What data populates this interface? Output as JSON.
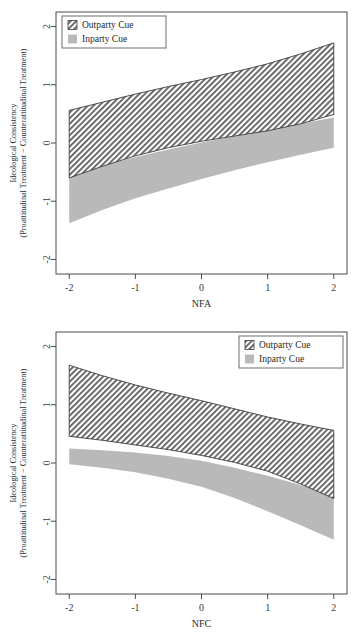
{
  "figure": {
    "background": "#ffffff",
    "series_colors": {
      "outparty": "#4a4a4a",
      "inparty": "#b9b9b9"
    }
  },
  "chart_data": [
    {
      "type": "area",
      "panel": "top",
      "title": "",
      "xlabel": "NFA",
      "ylabel": "Ideological Consistency",
      "ylabel_line2": "(Proattitudinal Treatment − Counterattitudinal Treatment)",
      "xlim": [
        -2.2,
        2.2
      ],
      "ylim": [
        -2.25,
        2.25
      ],
      "xticks": [
        -2,
        -1,
        0,
        1,
        2
      ],
      "xticklabels": [
        "-2",
        "-1",
        "0",
        "1",
        "2"
      ],
      "yticks": [
        -2,
        -1,
        0,
        1,
        2
      ],
      "yticklabels": [
        "-2",
        "-1",
        "0",
        "1",
        "2"
      ],
      "grid": false,
      "legend_position": "top-left",
      "legend": [
        {
          "label": "Outparty Cue",
          "style": "hatched"
        },
        {
          "label": "Inparty Cue",
          "style": "solid-gray"
        }
      ],
      "x": [
        -2,
        -1.5,
        -1,
        -0.5,
        0,
        0.5,
        1,
        1.5,
        2
      ],
      "series": [
        {
          "name": "Outparty Cue",
          "style": "hatched",
          "upper": [
            0.56,
            0.7,
            0.84,
            0.97,
            1.09,
            1.22,
            1.36,
            1.53,
            1.72
          ],
          "lower": [
            -0.6,
            -0.4,
            -0.22,
            -0.08,
            0.03,
            0.12,
            0.21,
            0.33,
            0.49
          ]
        },
        {
          "name": "Inparty Cue",
          "style": "solid-gray",
          "upper": [
            -0.55,
            -0.39,
            -0.24,
            -0.11,
            0.01,
            0.12,
            0.22,
            0.33,
            0.44
          ],
          "lower": [
            -1.38,
            -1.15,
            -0.95,
            -0.78,
            -0.62,
            -0.47,
            -0.33,
            -0.2,
            -0.08
          ]
        }
      ]
    },
    {
      "type": "area",
      "panel": "bottom",
      "title": "",
      "xlabel": "NFC",
      "ylabel": "Ideological Consistency",
      "ylabel_line2": "(Proattitudinal Treatment − Counterattitudinal Treatment)",
      "xlim": [
        -2.2,
        2.2
      ],
      "ylim": [
        -2.25,
        2.25
      ],
      "xticks": [
        -2,
        -1,
        0,
        1,
        2
      ],
      "xticklabels": [
        "-2",
        "-1",
        "0",
        "1",
        "2"
      ],
      "yticks": [
        -2,
        -1,
        0,
        1,
        2
      ],
      "yticklabels": [
        "-2",
        "-1",
        "0",
        "1",
        "2"
      ],
      "grid": false,
      "legend_position": "top-right",
      "legend": [
        {
          "label": "Outparty Cue",
          "style": "hatched"
        },
        {
          "label": "Inparty Cue",
          "style": "solid-gray"
        }
      ],
      "x": [
        -2,
        -1.5,
        -1,
        -0.5,
        0,
        0.5,
        1,
        1.5,
        2
      ],
      "series": [
        {
          "name": "Outparty Cue",
          "style": "hatched",
          "upper": [
            1.68,
            1.5,
            1.34,
            1.2,
            1.07,
            0.93,
            0.79,
            0.67,
            0.56
          ],
          "lower": [
            0.46,
            0.39,
            0.31,
            0.23,
            0.13,
            0.01,
            -0.14,
            -0.36,
            -0.61
          ]
        },
        {
          "name": "Inparty Cue",
          "style": "solid-gray",
          "upper": [
            0.25,
            0.22,
            0.18,
            0.12,
            0.04,
            -0.08,
            -0.22,
            -0.38,
            -0.55
          ],
          "lower": [
            -0.02,
            -0.08,
            -0.16,
            -0.27,
            -0.41,
            -0.6,
            -0.83,
            -1.07,
            -1.32
          ]
        }
      ]
    }
  ],
  "panels": {
    "top": {
      "xlabel": "NFA",
      "ylabel_line1": "Ideological Consistency",
      "ylabel_line2": "(Proattitudinal Treatment − Counterattitudinal Treatment)",
      "legend": {
        "outparty": "Outparty Cue",
        "inparty": "Inparty Cue"
      },
      "xticklabels": [
        "-2",
        "-1",
        "0",
        "1",
        "2"
      ],
      "yticklabels": [
        "-2",
        "-1",
        "0",
        "1",
        "2"
      ]
    },
    "bottom": {
      "xlabel": "NFC",
      "ylabel_line1": "Ideological Consistency",
      "ylabel_line2": "(Proattitudinal Treatment − Counterattitudinal Treatment)",
      "legend": {
        "outparty": "Outparty Cue",
        "inparty": "Inparty Cue"
      },
      "xticklabels": [
        "-2",
        "-1",
        "0",
        "1",
        "2"
      ],
      "yticklabels": [
        "-2",
        "-1",
        "0",
        "1",
        "2"
      ]
    }
  }
}
